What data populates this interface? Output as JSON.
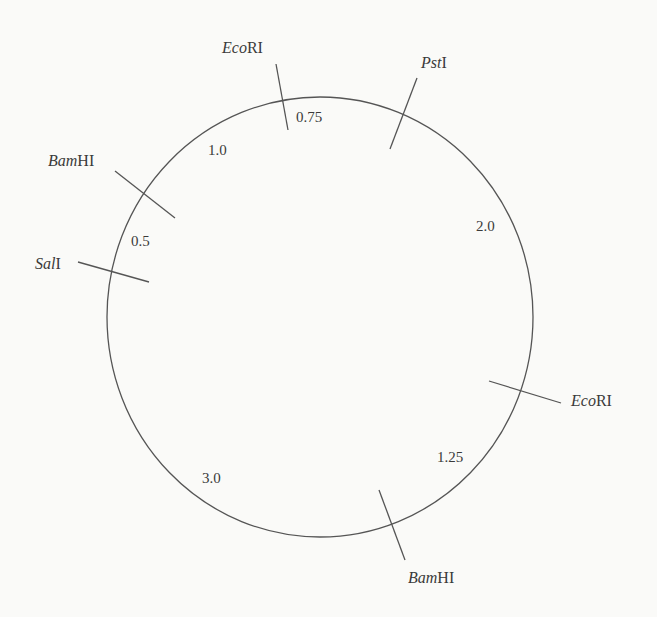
{
  "diagram": {
    "type": "circular restriction map",
    "sites": [
      {
        "id": "ecori_top",
        "italic": "Eco",
        "roman": "RI"
      },
      {
        "id": "psti",
        "italic": "Pst",
        "roman": "I"
      },
      {
        "id": "bamhi_left",
        "italic": "Bam",
        "roman": "HI"
      },
      {
        "id": "sali",
        "italic": "Sal",
        "roman": "I"
      },
      {
        "id": "ecori_right",
        "italic": "Eco",
        "roman": "RI"
      },
      {
        "id": "bamhi_bottom",
        "italic": "Bam",
        "roman": "HI"
      }
    ],
    "fragments": [
      {
        "between": "ecori_top-psti",
        "length": "0.75"
      },
      {
        "between": "psti-ecori_right",
        "length": "2.0"
      },
      {
        "between": "ecori_right-bamhi_bottom",
        "length": "1.25"
      },
      {
        "between": "bamhi_bottom-sali",
        "length": "3.0"
      },
      {
        "between": "sali-bamhi_left",
        "length": "0.5"
      },
      {
        "between": "bamhi_left-ecori_top",
        "length": "1.0"
      }
    ],
    "colors": {
      "line": "#555555",
      "text": "#3a3a3a",
      "background": "#fafaf8"
    }
  }
}
